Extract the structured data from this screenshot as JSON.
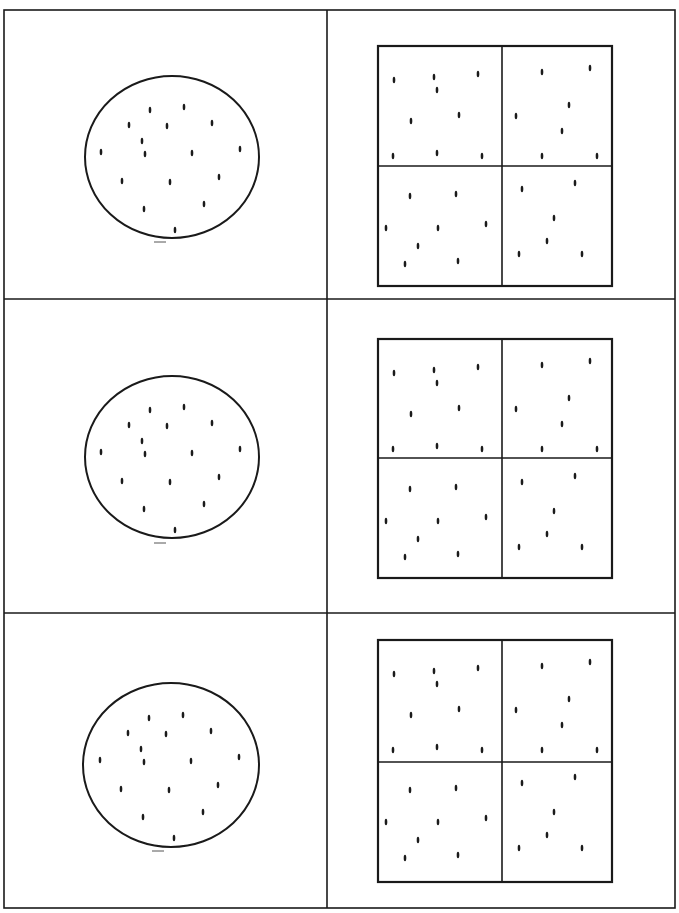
{
  "page": {
    "title": "",
    "background": "#ffffff",
    "line_color": "#1a1a1a"
  },
  "grid": {
    "rows": 3,
    "columns": 2,
    "outer": {
      "x": 4,
      "y": 10,
      "w": 671,
      "h": 898
    },
    "column_divider_x": 327,
    "row_dividers_y": [
      299,
      613
    ]
  },
  "rows": [
    {
      "label": "row-1",
      "circle": {
        "cx": 172,
        "cy": 157,
        "rx": 87,
        "ry": 81,
        "dot_count": 16,
        "tick_below": {
          "x": 160,
          "y": 242
        }
      },
      "square": {
        "x": 378,
        "y": 46,
        "w": 234,
        "h": 240,
        "split_x": 502,
        "split_y": 166,
        "quadrant_dot_counts": {
          "top_left": 9,
          "top_right": 7,
          "bottom_left": 8,
          "bottom_right": 6
        }
      }
    },
    {
      "label": "row-2",
      "circle": {
        "cx": 172,
        "cy": 457,
        "rx": 87,
        "ry": 81,
        "dot_count": 16,
        "tick_below": {
          "x": 160,
          "y": 543
        }
      },
      "square": {
        "x": 378,
        "y": 339,
        "w": 234,
        "h": 239,
        "split_x": 502,
        "split_y": 458,
        "quadrant_dot_counts": {
          "top_left": 9,
          "top_right": 7,
          "bottom_left": 8,
          "bottom_right": 6
        }
      }
    },
    {
      "label": "row-3",
      "circle": {
        "cx": 171,
        "cy": 765,
        "rx": 88,
        "ry": 82,
        "dot_count": 16,
        "tick_below": {
          "x": 158,
          "y": 851
        }
      },
      "square": {
        "x": 378,
        "y": 640,
        "w": 234,
        "h": 242,
        "split_x": 502,
        "split_y": 762,
        "quadrant_dot_counts": {
          "top_left": 9,
          "top_right": 7,
          "bottom_left": 8,
          "bottom_right": 6
        }
      }
    }
  ],
  "circle_dots_relative": [
    [
      -22,
      -47
    ],
    [
      12,
      -50
    ],
    [
      -43,
      -32
    ],
    [
      -5,
      -31
    ],
    [
      40,
      -34
    ],
    [
      -71,
      -5
    ],
    [
      -27,
      -3
    ],
    [
      20,
      -4
    ],
    [
      68,
      -8
    ],
    [
      -50,
      24
    ],
    [
      -2,
      25
    ],
    [
      47,
      20
    ],
    [
      -28,
      52
    ],
    [
      32,
      47
    ],
    [
      3,
      73
    ],
    [
      -30,
      -16
    ]
  ],
  "square_dots_relative": {
    "top_left": [
      [
        16,
        34
      ],
      [
        56,
        31
      ],
      [
        100,
        28
      ],
      [
        33,
        75
      ],
      [
        81,
        69
      ],
      [
        15,
        110
      ],
      [
        59,
        107
      ],
      [
        104,
        110
      ],
      [
        59,
        44
      ]
    ],
    "top_right": [
      [
        40,
        26
      ],
      [
        88,
        22
      ],
      [
        14,
        70
      ],
      [
        67,
        59
      ],
      [
        40,
        110
      ],
      [
        95,
        110
      ],
      [
        60,
        85
      ]
    ],
    "bottom_left": [
      [
        32,
        150
      ],
      [
        78,
        148
      ],
      [
        8,
        182
      ],
      [
        60,
        182
      ],
      [
        108,
        178
      ],
      [
        27,
        218
      ],
      [
        80,
        215
      ],
      [
        40,
        200
      ]
    ],
    "bottom_right": [
      [
        20,
        143
      ],
      [
        73,
        137
      ],
      [
        52,
        172
      ],
      [
        17,
        208
      ],
      [
        80,
        208
      ],
      [
        45,
        195
      ]
    ]
  }
}
